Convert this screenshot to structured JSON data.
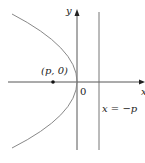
{
  "diagram": {
    "axes": {
      "x_label": "x",
      "y_label": "y",
      "origin_label": "0"
    },
    "focus": {
      "label": "(p, 0)"
    },
    "directrix": {
      "label": "x = −p"
    },
    "colors": {
      "curve": "#888888",
      "axis": "#444444",
      "point": "#111111",
      "text": "#222222"
    }
  }
}
